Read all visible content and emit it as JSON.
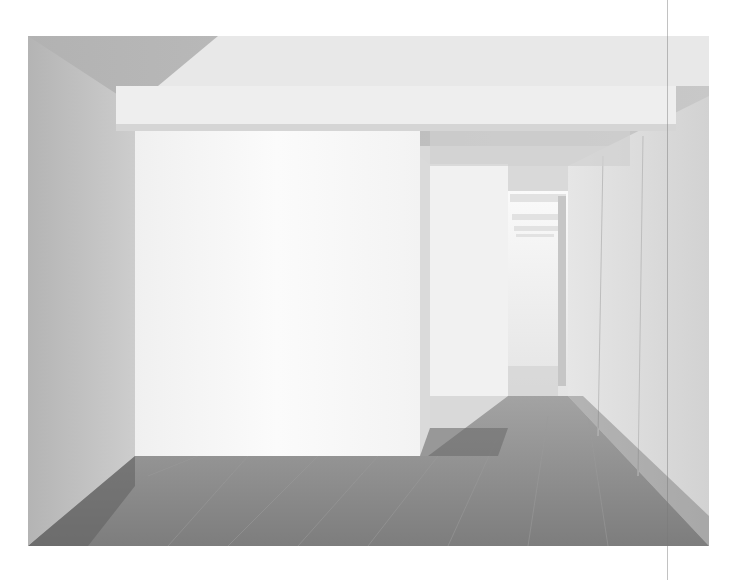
{
  "image": {
    "subject": "minimalist white gallery interior with grey plank floor and receding corridor",
    "alt": "Empty white-walled architectural interior with overhead beam, freestanding wall block, and a corridor of repeating doorways on the right"
  },
  "colors": {
    "page_background": "#ffffff",
    "wall_white": "#f7f7f7",
    "wall_left": "#b8b8b8",
    "ceiling_shadow": "#bdbdbd",
    "beam": "#ececec",
    "floor": "#8e8e8e",
    "floor_dark": "#6f6f6f",
    "right_wall": "#dcdcdc"
  }
}
